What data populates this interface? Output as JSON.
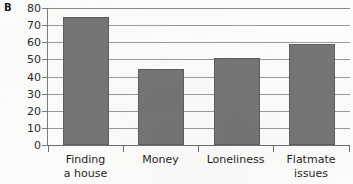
{
  "panel": {
    "label": "B"
  },
  "chart_data": {
    "type": "bar",
    "title": "",
    "subtitle": "",
    "xlabel": "",
    "ylabel": "",
    "categories": [
      "Finding a house",
      "Money",
      "Loneliness",
      "Flatmate issues"
    ],
    "category_lines": [
      [
        "Finding",
        "a house"
      ],
      [
        "Money",
        ""
      ],
      [
        "Loneliness",
        ""
      ],
      [
        "Flatmate",
        "issues"
      ]
    ],
    "values": [
      75,
      44.5,
      51,
      59
    ],
    "ylim": [
      0,
      80
    ],
    "ytick_step": 10,
    "yticks": [
      80,
      70,
      60,
      50,
      40,
      30,
      20,
      10,
      0
    ],
    "ytick_labels": [
      "80",
      "70",
      "60",
      "50",
      "40",
      "30",
      "20",
      "10",
      "0"
    ],
    "grid": true,
    "grid_axis": "y",
    "legend": false,
    "legend_position": "none",
    "bar_color": "#757575",
    "bar_edge_color": "#5f5f5f",
    "grid_color": "#9a9a9a",
    "axis_color": "#6f6f6f",
    "text_color": "#1f1f1f",
    "background_color": "#fcfcfa"
  }
}
